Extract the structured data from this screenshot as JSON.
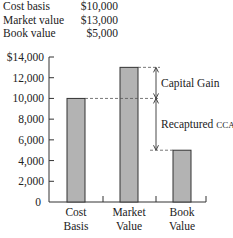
{
  "info": {
    "rows": [
      {
        "label": "Cost basis",
        "value": "$10,000"
      },
      {
        "label": "Market value",
        "value": "$13,000"
      },
      {
        "label": "Book value",
        "value": "$5,000"
      }
    ]
  },
  "chart_data": {
    "type": "bar",
    "title": "",
    "xlabel": "",
    "ylabel": "",
    "categories": [
      "Cost Basis",
      "Market Value",
      "Book Value"
    ],
    "category_lines": [
      [
        "Cost",
        "Basis"
      ],
      [
        "Market",
        "Value"
      ],
      [
        "Book",
        "Value"
      ]
    ],
    "values": [
      10000,
      13000,
      5000
    ],
    "ylim": [
      0,
      14000
    ],
    "yticks": [
      0,
      2000,
      4000,
      6000,
      8000,
      10000,
      12000,
      14000
    ],
    "ytick_labels": [
      "0",
      "2,000",
      "4,000",
      "6,000",
      "8,000",
      "10,000",
      "12,000",
      "$14,000"
    ],
    "grid": false,
    "bar_color": "#b3b3b3",
    "annotations": [
      {
        "label": "Capital Gain",
        "from": 10000,
        "to": 13000
      },
      {
        "label": "Recaptured CCA",
        "label_main": "Recaptured ",
        "label_small": "CCA",
        "from": 5000,
        "to": 10000
      }
    ]
  }
}
